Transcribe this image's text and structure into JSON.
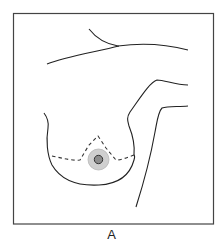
{
  "figure": {
    "caption": "A",
    "colors": {
      "frame": "#444444",
      "outline": "#222222",
      "dashed_incision": "#333333",
      "areola_fill": "#cfcfcf",
      "areola_stroke": "#b5b5b5",
      "nipple_fill": "#8c8c8c",
      "nipple_stroke": "#333333"
    },
    "elements": [
      {
        "name": "clavicle-line",
        "type": "solid-curve"
      },
      {
        "name": "chest-wall-line",
        "type": "solid-curve"
      },
      {
        "name": "arm-upper-contour",
        "type": "solid-curve"
      },
      {
        "name": "arm-lower-contour",
        "type": "solid-curve"
      },
      {
        "name": "breast-outline",
        "type": "solid-curve"
      },
      {
        "name": "wise-pattern-incision",
        "type": "dashed-line"
      },
      {
        "name": "areola",
        "type": "circle"
      },
      {
        "name": "nipple",
        "type": "circle"
      }
    ]
  }
}
